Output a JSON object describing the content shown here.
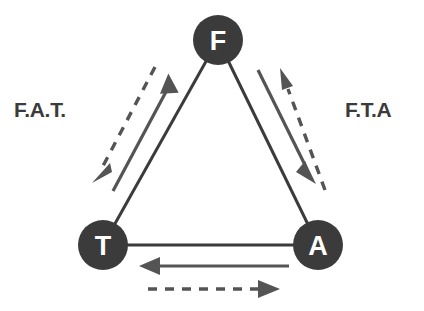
{
  "diagram": {
    "background_color": "#ffffff",
    "node_color": "#3b3b3b",
    "node_text_color": "#ffffff",
    "edge_color": "#3b3b3b",
    "flow_color": "#545454",
    "nodes": [
      {
        "id": "F",
        "label": "F",
        "cx": 218,
        "cy": 40,
        "r": 25
      },
      {
        "id": "T",
        "label": "T",
        "cx": 103,
        "cy": 245,
        "r": 25
      },
      {
        "id": "A",
        "label": "A",
        "cx": 318,
        "cy": 245,
        "r": 25
      }
    ],
    "edges": [
      {
        "from": "F",
        "to": "T",
        "style": "solid"
      },
      {
        "from": "F",
        "to": "A",
        "style": "solid"
      },
      {
        "from": "T",
        "to": "A",
        "style": "solid"
      }
    ],
    "flows": [
      {
        "side": "left",
        "style": "solid",
        "from": "T",
        "to": "F",
        "direction": "up-right"
      },
      {
        "side": "left",
        "style": "dashed",
        "from": "F",
        "to": "T",
        "direction": "down-left"
      },
      {
        "side": "right",
        "style": "solid",
        "from": "F",
        "to": "A",
        "direction": "down-right"
      },
      {
        "side": "right",
        "style": "dashed",
        "from": "A",
        "to": "F",
        "direction": "up-left"
      },
      {
        "side": "bottom",
        "style": "solid",
        "from": "A",
        "to": "T",
        "direction": "left"
      },
      {
        "side": "bottom",
        "style": "dashed",
        "from": "T",
        "to": "A",
        "direction": "right"
      }
    ],
    "labels": {
      "left": "F.A.T.",
      "right": "F.T.A"
    }
  }
}
